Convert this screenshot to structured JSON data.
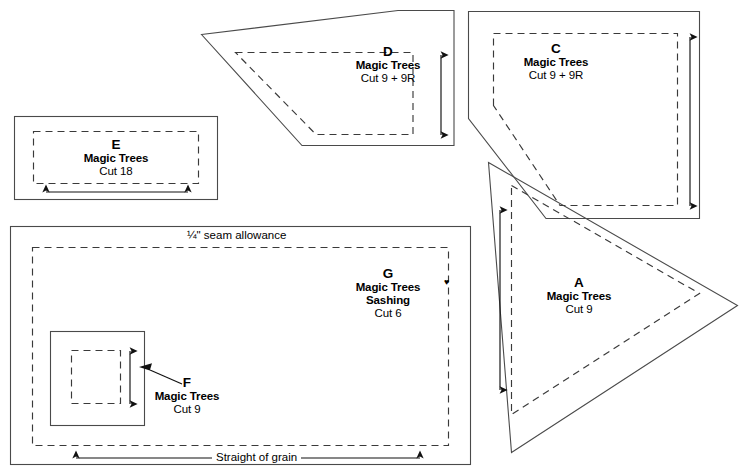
{
  "page": {
    "width": 745,
    "height": 476,
    "line_color": "#4a4a4a",
    "dash_color": "#3a3a3a",
    "text_color": "#000000",
    "background": "#ffffff"
  },
  "annotations": {
    "seam_allowance": "¼\" seam allowance",
    "straight_of_grain": "Straight of grain",
    "heart_glyph": "♥"
  },
  "templates": [
    {
      "id": "D",
      "letter": "D",
      "pattern": "Magic Trees",
      "cut": "Cut 9 + 9R",
      "shape": "right-triangle-notched",
      "grain_arrow": "vertical-double"
    },
    {
      "id": "C",
      "letter": "C",
      "pattern": "Magic Trees",
      "cut": "Cut 9 + 9R",
      "shape": "right-triangle-notched",
      "grain_arrow": "vertical-double"
    },
    {
      "id": "E",
      "letter": "E",
      "pattern": "Magic Trees",
      "cut": "Cut 18",
      "shape": "rectangle",
      "grain_arrow": "horizontal-double"
    },
    {
      "id": "A",
      "letter": "A",
      "pattern": "Magic Trees",
      "cut": "Cut 9",
      "shape": "triangle",
      "grain_arrow": "vertical-double"
    },
    {
      "id": "G",
      "letter": "G",
      "pattern": "Magic Trees",
      "sub": "Sashing",
      "cut": "Cut 6",
      "shape": "rectangle",
      "grain_arrow": "horizontal-double"
    },
    {
      "id": "F",
      "letter": "F",
      "pattern": "Magic Trees",
      "cut": "Cut 9",
      "shape": "square",
      "grain_arrow": "vertical-double"
    }
  ]
}
